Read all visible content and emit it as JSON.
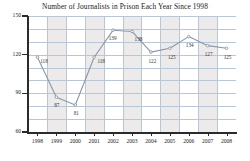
{
  "chart_data": {
    "type": "line",
    "title": "Number of Journalists in Prison Each Year Since 1998",
    "xlabel": "",
    "ylabel": "",
    "categories": [
      "1998",
      "1999",
      "2000",
      "2001",
      "2002",
      "2003",
      "2004",
      "2005",
      "2006",
      "2007",
      "2008"
    ],
    "values": [
      118,
      87,
      81,
      118,
      139,
      138,
      122,
      125,
      134,
      127,
      125
    ],
    "point_labels": [
      "118",
      "87",
      "81",
      "118",
      "139",
      "138",
      "122",
      "125",
      "134",
      "127",
      "125"
    ],
    "ylim": [
      60,
      150
    ],
    "yticks": [
      60,
      90,
      120,
      150
    ],
    "ytick_labels": [
      "60",
      "90",
      "120",
      "150"
    ],
    "grid": true,
    "legend": null,
    "series_color": "#8a97a8",
    "grid_color": "#b9c6d4",
    "band_color": "#eceaea",
    "axis_color": "#2b2b2b",
    "background": "#ffffff"
  },
  "axes": {
    "y_ticks": [
      {
        "label": "150",
        "value": 150
      },
      {
        "label": "120",
        "value": 120
      },
      {
        "label": "90",
        "value": 90
      },
      {
        "label": "60",
        "value": 60
      }
    ],
    "x_ticks": [
      {
        "label": "1998"
      },
      {
        "label": "1999"
      },
      {
        "label": "2000"
      },
      {
        "label": "2001"
      },
      {
        "label": "2002"
      },
      {
        "label": "2003"
      },
      {
        "label": "2004"
      },
      {
        "label": "2005"
      },
      {
        "label": "2006"
      },
      {
        "label": "2007"
      },
      {
        "label": "2008"
      }
    ]
  }
}
